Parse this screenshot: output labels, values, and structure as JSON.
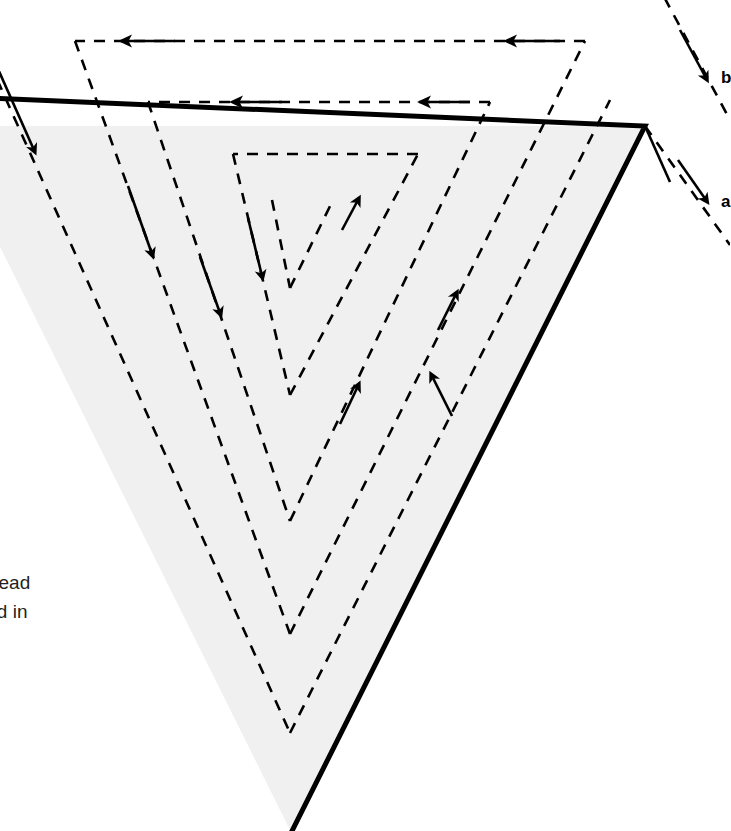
{
  "figure": {
    "canvas": {
      "width": 730,
      "height": 831
    },
    "colors": {
      "triangle_fill": "#f0f0f0",
      "triangle_stroke": "#000000",
      "path_stroke": "#000000",
      "background": "#ffffff",
      "caption_text": "#231f20"
    },
    "triangle": {
      "name": "wedge-region",
      "stroke_width": 5,
      "top_y": 126,
      "apex": {
        "x": 290,
        "y": 830
      },
      "top_right": {
        "x": 645,
        "y": 126
      },
      "peak_tick_end": {
        "x": 670,
        "y": 182
      }
    },
    "paths": {
      "count": 5,
      "style": "dashed",
      "dash_pattern": "11 9",
      "stroke_width": 2.6,
      "vertices_y": [
        288,
        395,
        521,
        634,
        733
      ],
      "vertex_x": 290,
      "horizontal_connectors_y": [
        41,
        102,
        154
      ],
      "arrow_direction_left_side": "down-right",
      "arrow_direction_right_side": "up-right",
      "arrow_direction_horizontal": "left"
    },
    "labels": {
      "b": "b",
      "a": "a"
    },
    "caption": {
      "line_1": "read",
      "line_2": "ad in"
    }
  }
}
